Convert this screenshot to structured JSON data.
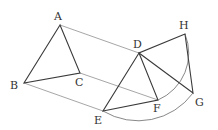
{
  "diagram": {
    "type": "geometry-rotation",
    "points": {
      "A": {
        "label": "A",
        "x": 60,
        "y": 25,
        "lx": 54,
        "ly": 20
      },
      "B": {
        "label": "B",
        "x": 24,
        "y": 83,
        "lx": 10,
        "ly": 89
      },
      "C": {
        "label": "C",
        "x": 80,
        "y": 73,
        "lx": 75,
        "ly": 86
      },
      "D": {
        "label": "D",
        "x": 139,
        "y": 53,
        "lx": 133,
        "ly": 48
      },
      "E": {
        "label": "E",
        "x": 103,
        "y": 111,
        "lx": 94,
        "ly": 124
      },
      "F": {
        "label": "F",
        "x": 158,
        "y": 100,
        "lx": 153,
        "ly": 112
      },
      "G": {
        "label": "G",
        "x": 193,
        "y": 93,
        "lx": 195,
        "ly": 106
      },
      "H": {
        "label": "H",
        "x": 185,
        "y": 34,
        "lx": 179,
        "ly": 29
      }
    },
    "segments": [
      [
        "A",
        "B"
      ],
      [
        "A",
        "C"
      ],
      [
        "B",
        "C"
      ],
      [
        "D",
        "E"
      ],
      [
        "D",
        "F"
      ],
      [
        "E",
        "F"
      ],
      [
        "D",
        "G"
      ],
      [
        "D",
        "H"
      ],
      [
        "H",
        "G"
      ]
    ],
    "translation_lines": [
      [
        "A",
        "D"
      ],
      [
        "B",
        "E"
      ],
      [
        "C",
        "F"
      ]
    ],
    "arcs": [
      {
        "from": "E",
        "to": "G",
        "center": "D"
      },
      {
        "from": "F",
        "to": "H",
        "center": "D"
      }
    ]
  }
}
